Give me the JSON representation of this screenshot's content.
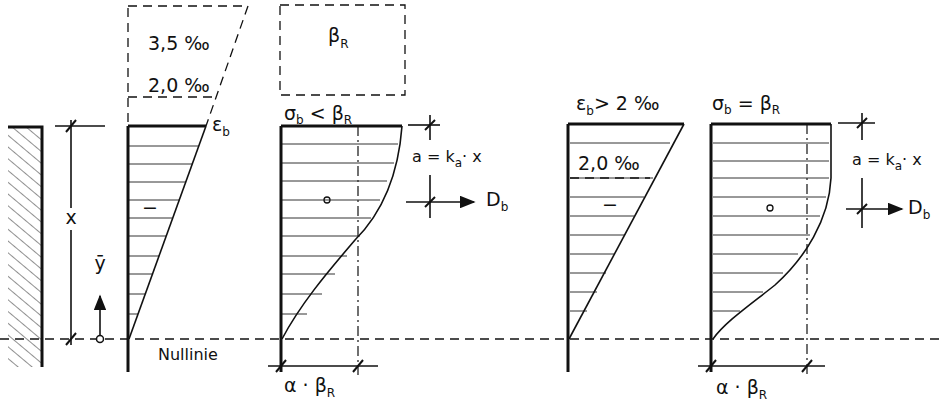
{
  "figure": {
    "left_strain": {
      "top_label": "3,5 ‰",
      "mid_label": "2,0 ‰",
      "edge_label_main": "ε",
      "edge_label_sub": "b",
      "sign": "−"
    },
    "left_stress": {
      "top_label_main": "β",
      "top_label_sub": "R",
      "condition_main": "σ",
      "condition_sub": "b",
      "condition_rest": " < β",
      "condition_sub2": "R",
      "sign": "o",
      "lever_arm": "a = k",
      "lever_arm_sub": "a",
      "lever_arm_rest": "· x",
      "force_main": "D",
      "force_sub": "b",
      "bottom_main": "α · β",
      "bottom_sub": "R"
    },
    "section": {
      "depth_label": "x",
      "coord_label": "ȳ",
      "neutral_axis_label": "Nullinie"
    },
    "right_strain": {
      "condition_main": "ε",
      "condition_sub": "b",
      "condition_rest": "> 2 ‰",
      "mid_label": "2,0 ‰",
      "sign": "−"
    },
    "right_stress": {
      "condition_main": "σ",
      "condition_sub": "b",
      "condition_rest": " = β",
      "condition_sub2": "R",
      "sign": "o",
      "lever_arm": "a = k",
      "lever_arm_sub": "a",
      "lever_arm_rest": "· x",
      "force_main": "D",
      "force_sub": "b",
      "bottom_main": "α  ·  β",
      "bottom_sub": "R"
    }
  }
}
